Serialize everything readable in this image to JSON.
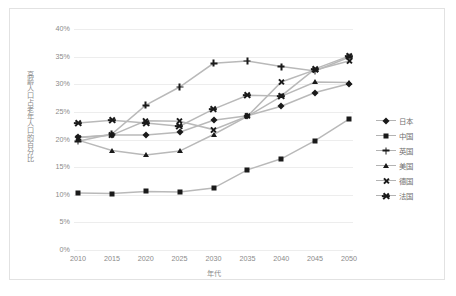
{
  "chart_data": {
    "type": "line",
    "title": "",
    "xlabel": "年代",
    "ylabel": "高齢人口占老年人口的百分比",
    "categories": [
      2010,
      2015,
      2020,
      2025,
      2030,
      2035,
      2040,
      2045,
      2050
    ],
    "x_tick_labels": [
      "2010",
      "2015",
      "2020",
      "2025",
      "2030",
      "2035",
      "2040",
      "2045",
      "2050"
    ],
    "y_tick_labels": [
      "0%",
      "5%",
      "10%",
      "15%",
      "20%",
      "25%",
      "30%",
      "35%",
      "40%"
    ],
    "y_tick_values": [
      0,
      5,
      10,
      15,
      20,
      25,
      30,
      35,
      40
    ],
    "ylim": [
      0,
      40
    ],
    "y_unit": "%",
    "grid": true,
    "legend_position": "right",
    "series": [
      {
        "name": "日本",
        "marker": "diamond",
        "values": [
          20.4,
          20.8,
          20.8,
          21.3,
          23.5,
          24.3,
          26.0,
          28.5,
          30.1
        ]
      },
      {
        "name": "中国",
        "marker": "square",
        "values": [
          10.3,
          10.2,
          10.6,
          10.5,
          11.2,
          14.5,
          16.5,
          19.8,
          23.7
        ]
      },
      {
        "name": "英国",
        "marker": "plus",
        "values": [
          19.7,
          21.0,
          26.2,
          29.5,
          33.8,
          34.2,
          33.2,
          32.4,
          34.9
        ]
      },
      {
        "name": "美国",
        "marker": "triangle",
        "values": [
          19.9,
          18.0,
          17.2,
          17.9,
          20.9,
          24.2,
          27.8,
          30.4,
          30.3
        ]
      },
      {
        "name": "德国",
        "marker": "cross",
        "values": [
          20.3,
          20.8,
          23.4,
          23.3,
          21.8,
          24.2,
          30.4,
          32.6,
          34.2
        ]
      },
      {
        "name": "法国",
        "marker": "star",
        "values": [
          23.0,
          23.5,
          23.0,
          22.4,
          25.5,
          28.0,
          27.9,
          32.8,
          35.1
        ]
      }
    ]
  }
}
